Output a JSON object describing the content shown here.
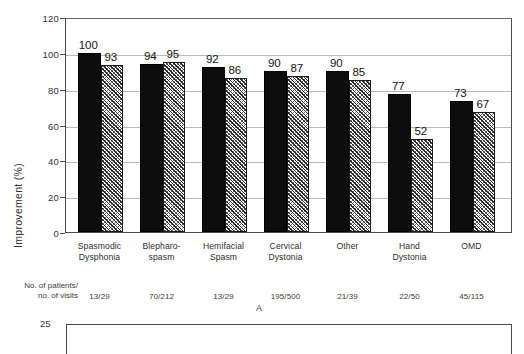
{
  "figure": {
    "panel_letter": "A",
    "ylabel": "Improvement (%)",
    "n_row_label_line1": "No. of patients/",
    "n_row_label_line2": "no. of visits",
    "next_panel_first_tick": "25"
  },
  "chart_data": {
    "type": "bar",
    "title": "",
    "xlabel": "",
    "ylabel": "Improvement (%)",
    "ylim": [
      0,
      120
    ],
    "yticks": [
      0,
      20,
      40,
      60,
      80,
      100,
      120
    ],
    "ytick_labels": [
      "0",
      "20",
      "40",
      "60",
      "80",
      "100",
      "120"
    ],
    "grid": true,
    "legend": "none",
    "categories": [
      "Spasmodic Dysphonia",
      "Blepharo-spasm",
      "Hemifacial Spasm",
      "Cervical Dystonia",
      "Other",
      "Hand Dystonia",
      "OMD"
    ],
    "category_label_lines": [
      [
        "Spasmodic",
        "Dysphonia"
      ],
      [
        "Blepharo-",
        "spasm"
      ],
      [
        "Hemifacial",
        "Spasm"
      ],
      [
        "Cervical",
        "Dystonia"
      ],
      [
        "Other",
        ""
      ],
      [
        "Hand",
        "Dystonia"
      ],
      [
        "OMD",
        ""
      ]
    ],
    "series": [
      {
        "name": "solid",
        "fill": "solid-black",
        "values": [
          100,
          94,
          92,
          90,
          90,
          77,
          73
        ]
      },
      {
        "name": "hatched",
        "fill": "diagonal-hatch",
        "values": [
          93,
          95,
          86,
          87,
          85,
          52,
          67
        ]
      }
    ],
    "n_values": [
      "13/29",
      "70/212",
      "13/29",
      "195/500",
      "21/39",
      "22/50",
      "45/115"
    ],
    "colors": {
      "solid_bar": "#0d0d0d",
      "hatch_bar_line": "#2a2a2a",
      "hatch_bar_bg": "#ffffff",
      "axis": "#4a4a4a",
      "gridline": "#b9b9b9",
      "text": "#2e2e2e"
    }
  }
}
